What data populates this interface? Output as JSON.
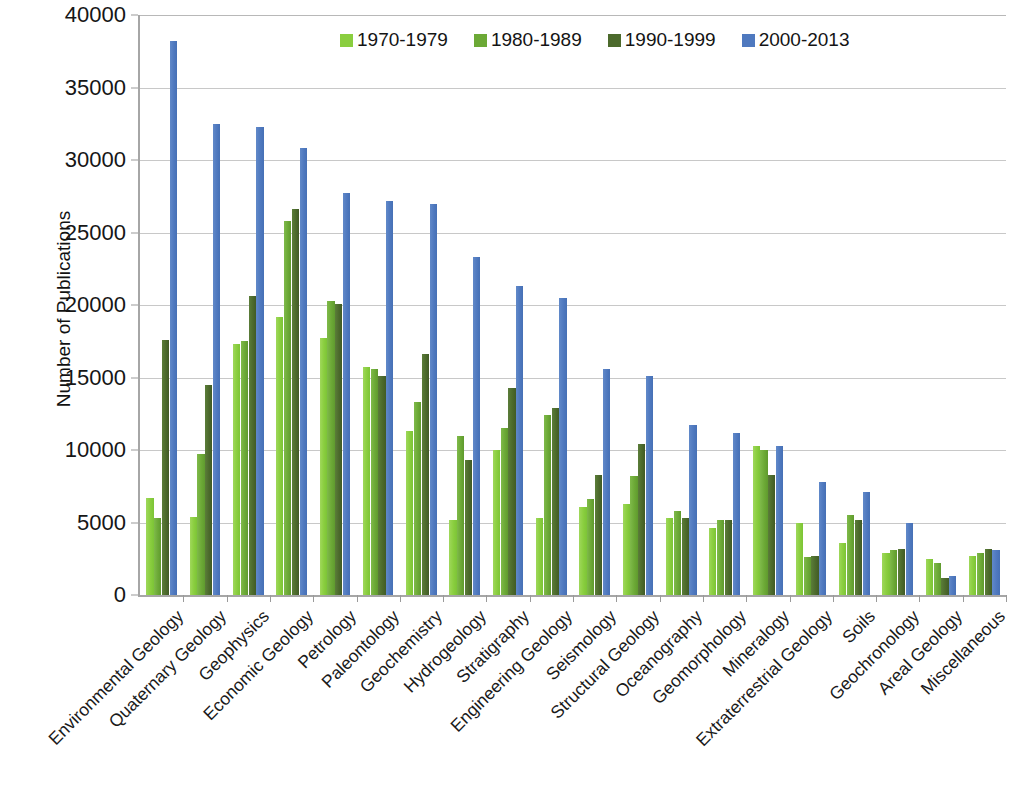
{
  "chart_data": {
    "type": "bar",
    "title": "",
    "xlabel": "",
    "ylabel": "Number of Publications",
    "ylim": [
      0,
      40000
    ],
    "ytick_step": 5000,
    "yticks": [
      "0",
      "5000",
      "10000",
      "15000",
      "20000",
      "25000",
      "30000",
      "35000",
      "40000"
    ],
    "grid": true,
    "legend_position": "top-center",
    "categories": [
      "Environmental Geology",
      "Quaternary Geology",
      "Geophysics",
      "Economic Geology",
      "Petrology",
      "Paleontology",
      "Geochemistry",
      "Hydrogeology",
      "Stratigraphy",
      "Engineering Geology",
      "Seismology",
      "Structural Geology",
      "Oceanography",
      "Geomorphology",
      "Mineralogy",
      "Extraterrestrial Geology",
      "Soils",
      "Geochronology",
      "Areal Geology",
      "Miscellaneous"
    ],
    "series": [
      {
        "name": "1970-1979",
        "color": "#8ACE3F",
        "values": [
          6700,
          5400,
          17300,
          19200,
          17700,
          15700,
          11300,
          5200,
          10000,
          5300,
          6100,
          6300,
          5300,
          4600,
          10300,
          5000,
          3600,
          2900,
          2500,
          2700
        ]
      },
      {
        "name": "1980-1989",
        "color": "#6CA936",
        "values": [
          5300,
          9700,
          17500,
          25800,
          20300,
          15600,
          13300,
          11000,
          11500,
          12400,
          6600,
          8200,
          5800,
          5200,
          10000,
          2600,
          5500,
          3100,
          2200,
          2900
        ]
      },
      {
        "name": "1990-1999",
        "color": "#4C6A2C",
        "values": [
          17600,
          14500,
          20600,
          26600,
          20100,
          15100,
          16600,
          9300,
          14300,
          12900,
          8300,
          10400,
          5300,
          5200,
          8300,
          2700,
          5200,
          3200,
          1200,
          3200
        ]
      },
      {
        "name": "2000-2013",
        "color": "#4F79BF",
        "values": [
          38200,
          32500,
          32300,
          30800,
          27700,
          27200,
          27000,
          23300,
          21300,
          20500,
          15600,
          15100,
          11700,
          11200,
          10300,
          7800,
          7100,
          5000,
          1300,
          3100
        ]
      }
    ]
  }
}
